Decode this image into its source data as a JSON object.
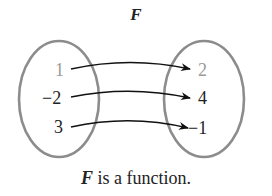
{
  "title": "F",
  "caption": {
    "italic_part": "F",
    "rest": " is a function."
  },
  "domain_set": [
    {
      "label": "1",
      "color": "#9a9a9a"
    },
    {
      "label": "−2",
      "color": "#222222"
    },
    {
      "label": "3",
      "color": "#222222"
    }
  ],
  "range_set": [
    {
      "label": "2",
      "color": "#9a9a9a"
    },
    {
      "label": "4",
      "color": "#222222"
    },
    {
      "label": "−1",
      "color": "#222222"
    }
  ],
  "mappings": [
    {
      "from": "1",
      "to": "2"
    },
    {
      "from": "−2",
      "to": "4"
    },
    {
      "from": "3",
      "to": "−1"
    }
  ],
  "colors": {
    "ellipse_stroke": "#8c8c8c",
    "arrow": "#111111",
    "text": "#222222",
    "muted_text": "#9a9a9a"
  }
}
